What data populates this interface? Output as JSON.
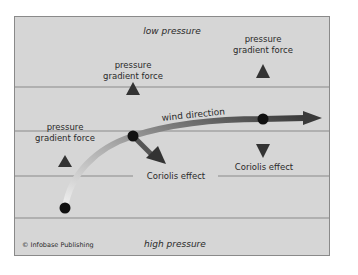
{
  "diagram": {
    "zones": {
      "top": "low pressure",
      "bottom": "high pressure"
    },
    "labels": {
      "pgf_left_line1": "pressure",
      "pgf_left_line2": "gradient force",
      "pgf_mid_line1": "pressure",
      "pgf_mid_line2": "gradient force",
      "pgf_right_line1": "pressure",
      "pgf_right_line2": "gradient force",
      "wind": "wind direction",
      "coriolis_mid": "Coriolis effect",
      "coriolis_right": "Coriolis effect"
    },
    "credit": "© Infobase Publishing",
    "colors": {
      "background": "#d6d6d6",
      "arrow": "#3a3a3a",
      "dot": "#111111",
      "line": "#8a8a8a",
      "wind_start": "#f2f2f2",
      "wind_end": "#444444"
    }
  }
}
